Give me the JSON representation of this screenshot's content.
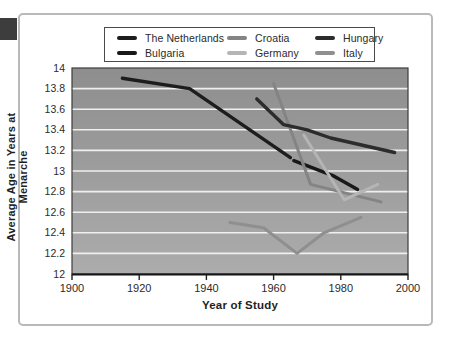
{
  "frame": {
    "border_color": "#b9b9b9",
    "corner_tab_color": "#3d3d3d"
  },
  "chart_data": {
    "type": "line",
    "title": "",
    "xlabel": "Year of Study",
    "ylabel": "Average Age in Years at Menarche",
    "xlim": [
      1900,
      2000
    ],
    "ylim": [
      12,
      14
    ],
    "x_ticks": [
      1900,
      1920,
      1940,
      1960,
      1980,
      2000
    ],
    "y_ticks": [
      12,
      12.2,
      12.4,
      12.6,
      12.8,
      13,
      13.2,
      13.4,
      13.6,
      13.8,
      14
    ],
    "grid": "horizontal-white-lines",
    "legend_position": "top-center",
    "plot_bg_gradient_top": "#8e8e8e",
    "plot_bg_gradient_bottom": "#acacac",
    "gridline_color": "#efefef",
    "plot_border_color": "#3c3c3c",
    "tick_label_color": "#2b2b2b",
    "series": [
      {
        "name": "The Netherlands",
        "color": "#1d1d1d",
        "width": 3.4,
        "points": [
          [
            1915,
            13.9
          ],
          [
            1935,
            13.8
          ],
          [
            1965,
            13.13
          ]
        ]
      },
      {
        "name": "Bulgaria",
        "color": "#181818",
        "width": 3.4,
        "points": [
          [
            1966,
            13.1
          ],
          [
            1978,
            12.95
          ],
          [
            1985,
            12.82
          ]
        ]
      },
      {
        "name": "Croatia",
        "color": "#848484",
        "width": 3.0,
        "points": [
          [
            1960,
            13.85
          ],
          [
            1971,
            12.87
          ],
          [
            1992,
            12.7
          ]
        ]
      },
      {
        "name": "Germany",
        "color": "#b5b5b5",
        "width": 3.0,
        "points": [
          [
            1969,
            13.35
          ],
          [
            1981,
            12.72
          ],
          [
            1991,
            12.87
          ]
        ]
      },
      {
        "name": "Hungary",
        "color": "#2c2c2c",
        "width": 3.4,
        "points": [
          [
            1955,
            13.7
          ],
          [
            1963,
            13.45
          ],
          [
            1970,
            13.4
          ],
          [
            1977,
            13.32
          ],
          [
            1996,
            13.18
          ]
        ]
      },
      {
        "name": "Italy",
        "color": "#8f8f8f",
        "width": 3.0,
        "points": [
          [
            1947,
            12.5
          ],
          [
            1957,
            12.45
          ],
          [
            1967,
            12.2
          ],
          [
            1975,
            12.4
          ],
          [
            1986,
            12.55
          ]
        ]
      }
    ],
    "legend_rows": [
      [
        "The Netherlands",
        "Croatia",
        "Hungary"
      ],
      [
        "Bulgaria",
        "Germany",
        "Italy"
      ]
    ]
  }
}
